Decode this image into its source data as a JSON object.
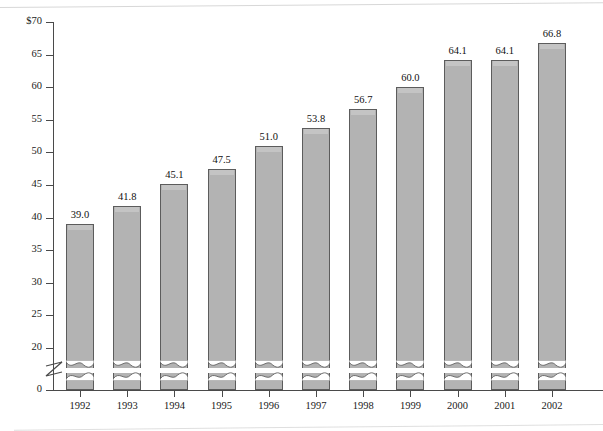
{
  "chart_data": {
    "type": "bar",
    "title": "",
    "subtitle": "",
    "xlabel": "",
    "ylabel": "",
    "categories": [
      "1992",
      "1993",
      "1994",
      "1995",
      "1996",
      "1997",
      "1998",
      "1999",
      "2000",
      "2001",
      "2002"
    ],
    "values": [
      39.0,
      41.8,
      45.1,
      47.5,
      51.0,
      53.8,
      56.7,
      60.0,
      64.1,
      64.1,
      66.8
    ],
    "value_labels": [
      "39.0",
      "41.8",
      "45.1",
      "47.5",
      "51.0",
      "53.8",
      "56.7",
      "60.0",
      "64.1",
      "64.1",
      "66.8"
    ],
    "ylim": [
      0,
      70
    ],
    "y_ticks": [
      0,
      20,
      25,
      30,
      35,
      40,
      45,
      50,
      55,
      60,
      65,
      70
    ],
    "y_tick_labels": [
      "0",
      "20",
      "25",
      "30",
      "35",
      "40",
      "45",
      "50",
      "55",
      "60",
      "65",
      "70"
    ],
    "y_axis_top_label": "$70",
    "y_axis_break": true,
    "y_axis_break_between": [
      0,
      20
    ],
    "grid": false,
    "legend": null,
    "series": [
      {
        "name": "",
        "values": [
          39.0,
          41.8,
          45.1,
          47.5,
          51.0,
          53.8,
          56.7,
          60.0,
          64.1,
          64.1,
          66.8
        ]
      }
    ],
    "colors": {
      "bar_fill": "#b3b3b3",
      "bar_highlight": "#c4c4c4",
      "bar_border": "#5c5c5c",
      "axis": "#4a4a4a",
      "text": "#1a1a1a",
      "background": "#ffffff"
    }
  }
}
